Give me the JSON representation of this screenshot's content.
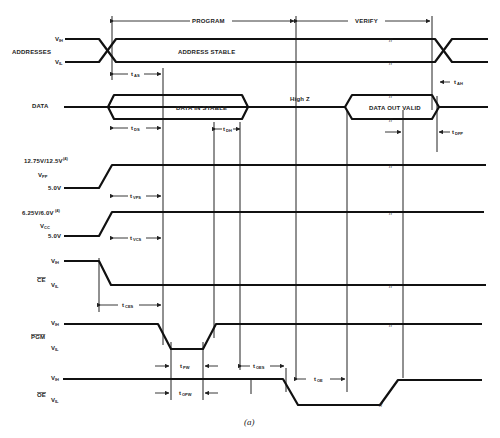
{
  "figure": {
    "caption": "(a)",
    "phases": {
      "program": "PROGRAM",
      "verify": "VERIFY"
    }
  },
  "signals": {
    "addresses": {
      "name": "ADDRESSES",
      "high": "V",
      "high_sub": "IH",
      "low": "V",
      "low_sub": "IL",
      "stable_label": "ADDRESS STABLE"
    },
    "data": {
      "name": "DATA",
      "in_label": "DATA IN STABLE",
      "highz_label": "High Z",
      "out_label": "DATA OUT VALID"
    },
    "vpp": {
      "name": "V",
      "name_sub": "PP",
      "high": "12.75V/12.5V",
      "high_note": "(4)",
      "low": "5.0V"
    },
    "vcc": {
      "name": "V",
      "name_sub": "CC",
      "high": "6.25V/6.0V",
      "high_note": "(4)",
      "low": "5.0V"
    },
    "ce": {
      "name": "CE",
      "active_low": true,
      "high": "V",
      "high_sub": "IH",
      "low": "V",
      "low_sub": "IL"
    },
    "pgm": {
      "name": "PGM",
      "active_low": true,
      "high": "V",
      "high_sub": "IH",
      "low": "V",
      "low_sub": "IL"
    },
    "oe": {
      "name": "OE",
      "active_low": true,
      "high": "V",
      "high_sub": "IH",
      "low": "V",
      "low_sub": "IL"
    }
  },
  "timing_params": [
    {
      "id": "tAS",
      "t": "t",
      "sub": "AS"
    },
    {
      "id": "tDS",
      "t": "t",
      "sub": "DS"
    },
    {
      "id": "tDH",
      "t": "t",
      "sub": "DH"
    },
    {
      "id": "tVPS",
      "t": "t",
      "sub": "VPS"
    },
    {
      "id": "tVCS",
      "t": "t",
      "sub": "VCS"
    },
    {
      "id": "tCES",
      "t": "t",
      "sub": "CES"
    },
    {
      "id": "tPW",
      "t": "t",
      "sub": "PW"
    },
    {
      "id": "tOPW",
      "t": "t",
      "sub": "OPW"
    },
    {
      "id": "tOES",
      "t": "t",
      "sub": "OES"
    },
    {
      "id": "tOE",
      "t": "t",
      "sub": "OE"
    },
    {
      "id": "tAH",
      "t": "t",
      "sub": "AH"
    },
    {
      "id": "tDFP",
      "t": "t",
      "sub": "DFP"
    }
  ],
  "break_mark": "//"
}
